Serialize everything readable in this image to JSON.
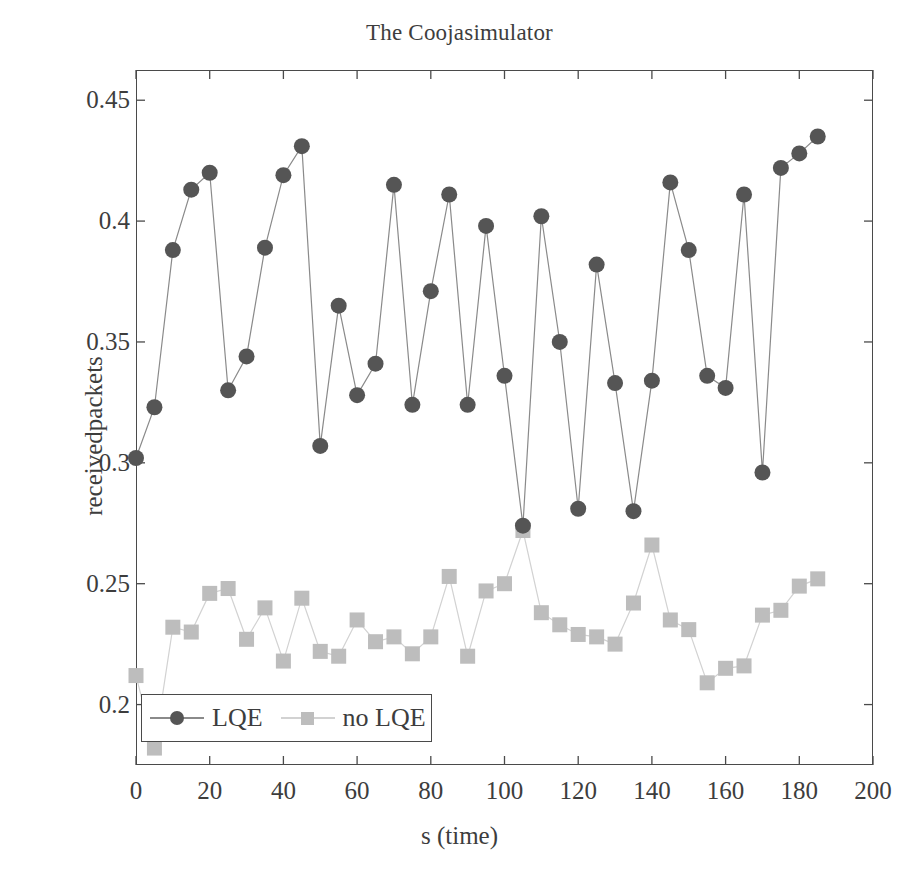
{
  "chart_data": {
    "type": "line",
    "title": "The Coojasimulator",
    "xlabel": "s (time)",
    "ylabel": "receivedpackets",
    "xlim": [
      0,
      200
    ],
    "ylim": [
      0.175,
      0.4625
    ],
    "xticks": [
      0,
      20,
      40,
      60,
      80,
      100,
      120,
      140,
      160,
      180,
      200
    ],
    "xtick_labels": [
      "0",
      "20",
      "40",
      "60",
      "80",
      "100",
      "120",
      "140",
      "160",
      "180",
      "200"
    ],
    "yticks": [
      0.2,
      0.25,
      0.3,
      0.35,
      0.4,
      0.45
    ],
    "ytick_labels": [
      "0.2",
      "0.25",
      "0.3",
      "0.35",
      "0.4",
      "0.45"
    ],
    "grid": false,
    "legend_position": "lower left",
    "x": [
      0,
      5,
      10,
      15,
      20,
      25,
      30,
      35,
      40,
      45,
      50,
      55,
      60,
      65,
      70,
      75,
      80,
      85,
      90,
      95,
      100,
      105,
      110,
      115,
      120,
      125,
      130,
      135,
      140,
      145,
      150,
      155,
      160,
      165,
      170,
      175,
      180,
      185
    ],
    "series": [
      {
        "name": "LQE",
        "marker": "circle",
        "color": "#555555",
        "line_color": "#8a8a8a",
        "values": [
          0.302,
          0.323,
          0.388,
          0.413,
          0.42,
          0.33,
          0.344,
          0.389,
          0.419,
          0.431,
          0.307,
          0.365,
          0.328,
          0.341,
          0.415,
          0.324,
          0.371,
          0.411,
          0.324,
          0.398,
          0.336,
          0.274,
          0.402,
          0.35,
          0.281,
          0.382,
          0.333,
          0.28,
          0.334,
          0.416,
          0.388,
          0.336,
          0.331,
          0.411,
          0.296,
          0.422,
          0.428,
          0.435
        ]
      },
      {
        "name": "no LQE",
        "marker": "square",
        "color": "#bdbdbd",
        "line_color": "#d2d2d2",
        "values": [
          0.212,
          0.182,
          0.232,
          0.23,
          0.246,
          0.248,
          0.227,
          0.24,
          0.218,
          0.244,
          0.222,
          0.22,
          0.235,
          0.226,
          0.228,
          0.221,
          0.228,
          0.253,
          0.22,
          0.247,
          0.25,
          0.272,
          0.238,
          0.233,
          0.229,
          0.228,
          0.225,
          0.242,
          0.266,
          0.235,
          0.231,
          0.209,
          0.215,
          0.216,
          0.237,
          0.239,
          0.249,
          0.252
        ]
      }
    ]
  },
  "legend": {
    "entries": [
      {
        "label": "LQE"
      },
      {
        "label": "no LQE"
      }
    ]
  },
  "colors": {
    "lqe_marker": "#555555",
    "lqe_line": "#8a8a8a",
    "nolqe_marker": "#bdbdbd",
    "nolqe_line": "#d2d2d2",
    "axis": "#4a4a4a",
    "text": "#3d3d3d",
    "background": "#ffffff"
  }
}
